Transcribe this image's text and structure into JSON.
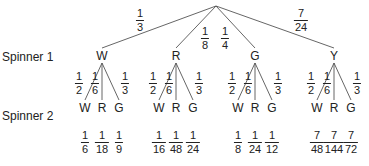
{
  "labels": {
    "spinner1": "Spinner 1",
    "spinner2": "Spinner 2"
  },
  "root": {
    "x": 216,
    "y": 6
  },
  "spinner1": [
    {
      "outcome": "W",
      "x": 102,
      "prob": {
        "num": "1",
        "den": "3"
      },
      "prob_pos": {
        "x": 140,
        "y": 8
      }
    },
    {
      "outcome": "R",
      "x": 176,
      "prob": {
        "num": "1",
        "den": "8"
      },
      "prob_pos": {
        "x": 205,
        "y": 26
      }
    },
    {
      "outcome": "G",
      "x": 255,
      "prob": {
        "num": "1",
        "den": "4"
      },
      "prob_pos": {
        "x": 225,
        "y": 26
      }
    },
    {
      "outcome": "Y",
      "x": 334,
      "prob": {
        "num": "7",
        "den": "24"
      },
      "prob_pos": {
        "x": 301,
        "y": 8
      }
    }
  ],
  "spinner2": [
    {
      "parent": "W",
      "branches": [
        {
          "outcome": "W",
          "prob": {
            "num": "1",
            "den": "2"
          },
          "joint": {
            "num": "1",
            "den": "6"
          }
        },
        {
          "outcome": "R",
          "prob": {
            "num": "1",
            "den": "6"
          },
          "joint": {
            "num": "1",
            "den": "18"
          }
        },
        {
          "outcome": "G",
          "prob": {
            "num": "1",
            "den": "3"
          },
          "joint": {
            "num": "1",
            "den": "9"
          }
        }
      ]
    },
    {
      "parent": "R",
      "branches": [
        {
          "outcome": "W",
          "prob": {
            "num": "1",
            "den": "2"
          },
          "joint": {
            "num": "1",
            "den": "16"
          }
        },
        {
          "outcome": "R",
          "prob": {
            "num": "1",
            "den": "6"
          },
          "joint": {
            "num": "1",
            "den": "48"
          }
        },
        {
          "outcome": "G",
          "prob": {
            "num": "1",
            "den": "3"
          },
          "joint": {
            "num": "1",
            "den": "24"
          }
        }
      ]
    },
    {
      "parent": "G",
      "branches": [
        {
          "outcome": "W",
          "prob": {
            "num": "1",
            "den": "2"
          },
          "joint": {
            "num": "1",
            "den": "8"
          }
        },
        {
          "outcome": "R",
          "prob": {
            "num": "1",
            "den": "6"
          },
          "joint": {
            "num": "1",
            "den": "24"
          }
        },
        {
          "outcome": "G",
          "prob": {
            "num": "1",
            "den": "3"
          },
          "joint": {
            "num": "1",
            "den": "12"
          }
        }
      ]
    },
    {
      "parent": "Y",
      "branches": [
        {
          "outcome": "W",
          "prob": {
            "num": "1",
            "den": "2"
          },
          "joint": {
            "num": "7",
            "den": "48"
          }
        },
        {
          "outcome": "R",
          "prob": {
            "num": "1",
            "den": "6"
          },
          "joint": {
            "num": "7",
            "den": "144"
          }
        },
        {
          "outcome": "G",
          "prob": {
            "num": "1",
            "den": "3"
          },
          "joint": {
            "num": "7",
            "den": "72"
          }
        }
      ]
    }
  ],
  "colors": {
    "line": "#555555",
    "text": "#222222"
  }
}
